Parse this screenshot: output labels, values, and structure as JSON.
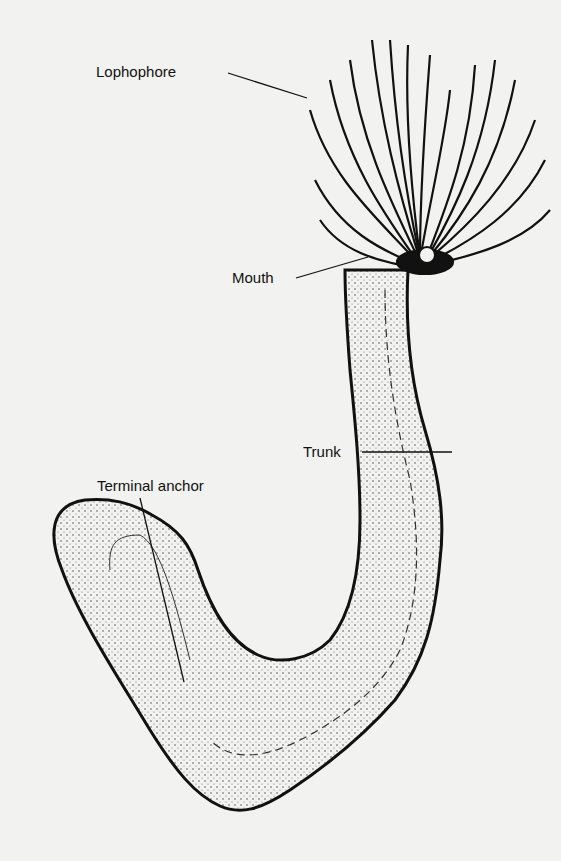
{
  "figure": {
    "labels": {
      "lophophore": "Lophophore",
      "mouth": "Mouth",
      "trunk": "Trunk",
      "terminal_anchor": "Terminal anchor"
    },
    "colors": {
      "background": "#f2f2f0",
      "ink": "#111111"
    }
  }
}
